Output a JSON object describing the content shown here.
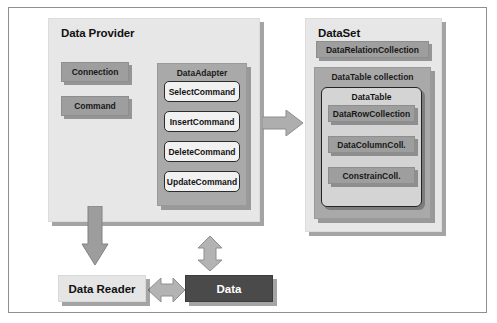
{
  "diagram": {
    "colors": {
      "panel_bg": "#e7e7e7",
      "subpanel_bg": "#a9a9a9",
      "chip_bg": "#9e9e9e",
      "command_bg": "#f1f1f1",
      "dark_box_bg": "#4a4a4a",
      "arrow_fill": "#a3a3a3",
      "frame_border": "#8f8f8f"
    },
    "data_provider": {
      "title": "Data Provider",
      "chips": [
        {
          "label": "Connection"
        },
        {
          "label": "Command"
        }
      ],
      "data_adapter": {
        "title": "DataAdapter",
        "commands": [
          {
            "label": "SelectCommand"
          },
          {
            "label": "InsertCommand"
          },
          {
            "label": "DeleteCommand"
          },
          {
            "label": "UpdateCommand"
          }
        ]
      }
    },
    "dataset": {
      "title": "DataSet",
      "relation_collection": {
        "label": "DataRelationCollection"
      },
      "datatable_collection": {
        "title": "DataTable collection",
        "datatable": {
          "title": "DataTable",
          "chips": [
            {
              "label": "DataRowCollection"
            },
            {
              "label": "DataColumnColl."
            },
            {
              "label": "ConstrainColl."
            }
          ]
        }
      }
    },
    "bottom": {
      "data_reader": {
        "label": "Data Reader"
      },
      "data": {
        "label": "Data"
      }
    },
    "arrows": [
      {
        "name": "adapter-to-dataset-arrow",
        "direction": "right"
      },
      {
        "name": "provider-to-datareader-arrow",
        "direction": "down"
      },
      {
        "name": "dataset-to-data-arrow",
        "direction": "up-down"
      },
      {
        "name": "datareader-data-arrow",
        "direction": "left-right"
      }
    ]
  }
}
